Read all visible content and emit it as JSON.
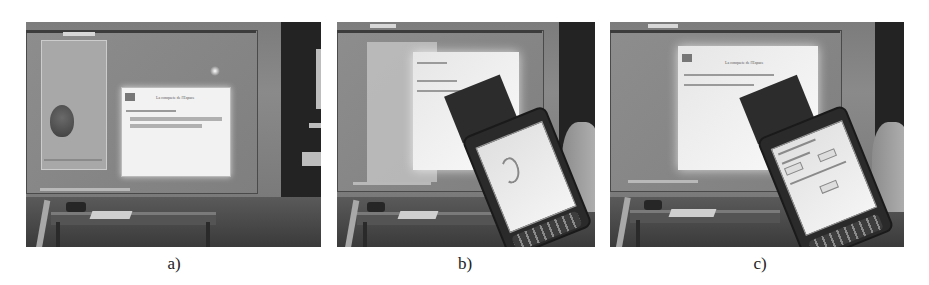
{
  "figure": {
    "panels": [
      {
        "id": "a",
        "caption": "a)",
        "description": "Classroom whiteboard with projected video window and slide window",
        "projected_window_title": "La conquete de l'Espace"
      },
      {
        "id": "b",
        "caption": "b)",
        "description": "Same scene with PDA held in front of projected slide (faded projection)"
      },
      {
        "id": "c",
        "caption": "c)",
        "description": "Same scene with PDA showing form interface in front of bright projection",
        "projected_window_title": "La conquete de l'Espace"
      }
    ]
  }
}
